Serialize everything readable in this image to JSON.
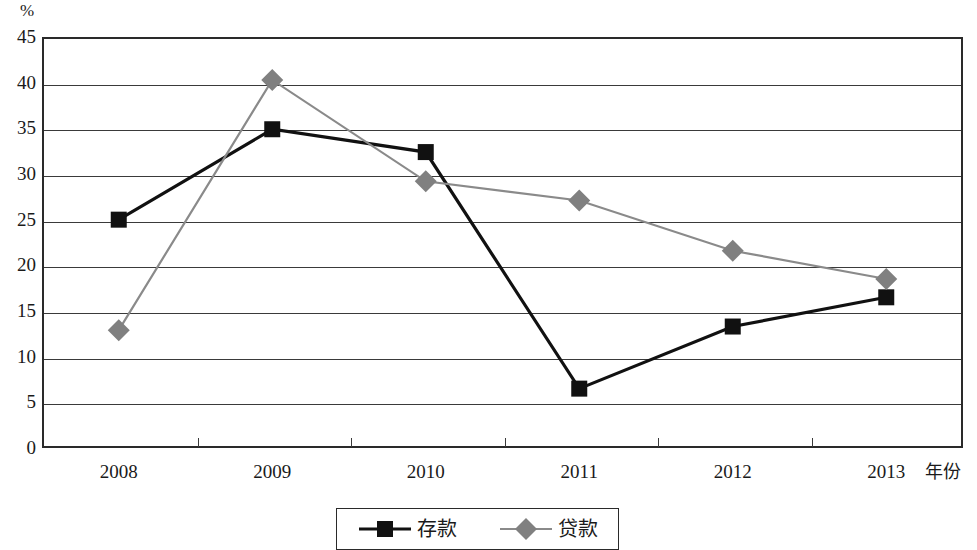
{
  "chart_data": {
    "type": "line",
    "title": "",
    "xlabel": "年份",
    "ylabel": "%",
    "unit_label": "%",
    "categories": [
      "2008",
      "2009",
      "2010",
      "2011",
      "2012",
      "2013"
    ],
    "x_tick_labels": [
      "2008",
      "2009",
      "2010",
      "2011",
      "2012",
      "2013"
    ],
    "y_tick_labels": [
      "45",
      "40",
      "35",
      "30",
      "25",
      "20",
      "15",
      "10",
      "5",
      "0"
    ],
    "ylim": [
      0,
      45
    ],
    "y_step": 5,
    "grid": true,
    "grid_axis": "y",
    "legend_position": "bottom-center",
    "series": [
      {
        "name": "存款",
        "marker": "square",
        "color": "#111111",
        "line_color": "#111111",
        "values": [
          25.0,
          34.9,
          32.4,
          6.5,
          13.3,
          16.5
        ]
      },
      {
        "name": "贷款",
        "marker": "diamond",
        "color": "#808080",
        "line_color": "#8a8a8a",
        "values": [
          12.9,
          40.3,
          29.2,
          27.1,
          21.6,
          18.5
        ]
      }
    ]
  },
  "legend": {
    "entries": [
      {
        "label": "存款",
        "marker": "square-marker-icon"
      },
      {
        "label": "贷款",
        "marker": "diamond-marker-icon"
      }
    ]
  },
  "axes": {
    "y_unit": "%",
    "x_title": "年份"
  }
}
